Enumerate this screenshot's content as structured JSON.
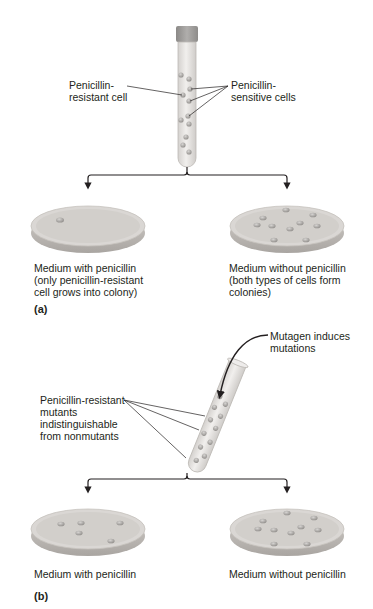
{
  "figure": {
    "panel_a": {
      "panel_label": "(a)",
      "tube_labels": {
        "resistant": [
          "Penicillin-",
          "resistant cell"
        ],
        "sensitive": [
          "Penicillin-",
          "sensitive cells"
        ]
      },
      "left_dish": {
        "caption": [
          "Medium with penicillin",
          "(only penicillin-resistant",
          "cell grows into colony)"
        ],
        "colony_count": 1
      },
      "right_dish": {
        "caption": [
          "Medium without penicillin",
          "(both types of cells form",
          "colonies)"
        ],
        "colony_count": 10
      }
    },
    "panel_b": {
      "panel_label": "(b)",
      "mutagen_label": [
        "Mutagen induces",
        "mutations"
      ],
      "mutants_label": [
        "Penicillin-resistant",
        "mutants",
        "indistinguishable",
        "from nonmutants"
      ],
      "left_dish": {
        "caption": [
          "Medium with penicillin"
        ],
        "colony_count": 5
      },
      "right_dish": {
        "caption": [
          "Medium without penicillin"
        ],
        "colony_count": 10
      }
    },
    "colors": {
      "dish_fill": "#d9d6d3",
      "dish_rim": "#bdb9b5",
      "tube_fill": "#e6e3e0",
      "cap": "#9a9896",
      "colony": "#9d9a97",
      "line": "#231f20"
    }
  }
}
